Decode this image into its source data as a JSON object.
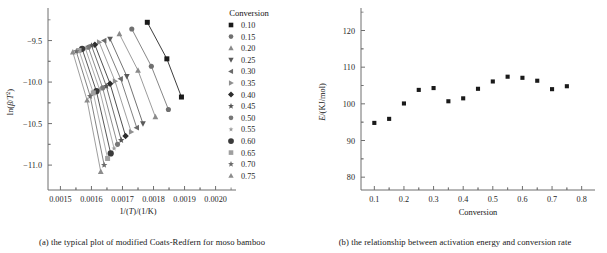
{
  "figure": {
    "panels": [
      {
        "id": "panel-a",
        "caption": "(a) the typical plot of modified Coats-Redfern for moso bamboo"
      },
      {
        "id": "panel-b",
        "caption": "(b) the relationship between activation energy and conversion rate"
      }
    ]
  },
  "legend": {
    "title": "Conversion",
    "entries": [
      {
        "label": "0.10",
        "marker": "square",
        "color": "#1a1a1a"
      },
      {
        "label": "0.15",
        "marker": "circle",
        "color": "#707070"
      },
      {
        "label": "0.20",
        "marker": "triangle-up",
        "color": "#8a8a8a"
      },
      {
        "label": "0.25",
        "marker": "triangle-down",
        "color": "#5a5a5a"
      },
      {
        "label": "0.30",
        "marker": "triangle-left",
        "color": "#6a6a6a"
      },
      {
        "label": "0.35",
        "marker": "triangle-right",
        "color": "#8f8f8f"
      },
      {
        "label": "0.40",
        "marker": "diamond",
        "color": "#2e2e2e"
      },
      {
        "label": "0.45",
        "marker": "star",
        "color": "#555555"
      },
      {
        "label": "0.50",
        "marker": "circle",
        "color": "#777777"
      },
      {
        "label": "0.55",
        "marker": "star-small",
        "color": "#9a9a9a"
      },
      {
        "label": "0.60",
        "marker": "circle-large",
        "color": "#3a3a3a"
      },
      {
        "label": "0.65",
        "marker": "square-light",
        "color": "#9f9f9f"
      },
      {
        "label": "0.70",
        "marker": "star",
        "color": "#6b6b6b"
      },
      {
        "label": "0.75",
        "marker": "triangle-up",
        "color": "#8c8c8c"
      }
    ]
  },
  "chart_data": [
    {
      "type": "line",
      "id": "coats-redfern",
      "title": "",
      "xlabel": "1/(T)/(1/K)",
      "ylabel": "ln(β/T²)",
      "xlim": [
        0.00146,
        0.00204
      ],
      "ylim": [
        -11.3,
        -9.18
      ],
      "xticks": [
        0.0015,
        0.0016,
        0.0017,
        0.0018,
        0.0019,
        0.002
      ],
      "xticklabels": [
        "0.0015",
        "0.0016",
        "0.0017",
        "0.0018",
        "0.0019",
        "0.0020"
      ],
      "yticks": [
        -9.5,
        -10.0,
        -10.5,
        -11.0
      ],
      "yticklabels": [
        "−9.5",
        "−10.0",
        "−10.5",
        "−11.0"
      ],
      "grid": false,
      "legend_position": "right",
      "series": [
        {
          "name": "0.10",
          "marker": "square",
          "color": "#1a1a1a",
          "x": [
            0.00178,
            0.001843,
            0.00189
          ],
          "y": [
            -9.28,
            -9.72,
            -10.18
          ]
        },
        {
          "name": "0.15",
          "marker": "circle",
          "color": "#707070",
          "x": [
            0.00173,
            0.001793,
            0.001848
          ],
          "y": [
            -9.36,
            -9.81,
            -10.33
          ]
        },
        {
          "name": "0.20",
          "marker": "triangle-up",
          "color": "#8a8a8a",
          "x": [
            0.00169,
            0.00175,
            0.001806
          ],
          "y": [
            -9.42,
            -9.86,
            -10.42
          ]
        },
        {
          "name": "0.25",
          "marker": "triangle-down",
          "color": "#5a5a5a",
          "x": [
            0.00166,
            0.001714,
            0.001766
          ],
          "y": [
            -9.48,
            -9.93,
            -10.5
          ]
        },
        {
          "name": "0.30",
          "marker": "triangle-left",
          "color": "#6a6a6a",
          "x": [
            0.001641,
            0.001694,
            0.001746
          ],
          "y": [
            -9.5,
            -9.96,
            -10.55
          ]
        },
        {
          "name": "0.35",
          "marker": "triangle-right",
          "color": "#8f8f8f",
          "x": [
            0.001625,
            0.001676,
            0.001728
          ],
          "y": [
            -9.52,
            -9.99,
            -10.6
          ]
        },
        {
          "name": "0.40",
          "marker": "diamond",
          "color": "#2e2e2e",
          "x": [
            0.001611,
            0.00166,
            0.00171
          ],
          "y": [
            -9.55,
            -10.02,
            -10.65
          ]
        },
        {
          "name": "0.45",
          "marker": "star",
          "color": "#555555",
          "x": [
            0.0016,
            0.001648,
            0.001696
          ],
          "y": [
            -9.56,
            -10.05,
            -10.7
          ]
        },
        {
          "name": "0.50",
          "marker": "circle",
          "color": "#777777",
          "x": [
            0.00159,
            0.001636,
            0.001684
          ],
          "y": [
            -9.58,
            -10.07,
            -10.75
          ]
        },
        {
          "name": "0.55",
          "marker": "star-small",
          "color": "#9a9a9a",
          "x": [
            0.00158,
            0.001626,
            0.001673
          ],
          "y": [
            -9.59,
            -10.09,
            -10.8
          ]
        },
        {
          "name": "0.60",
          "marker": "circle-large",
          "color": "#3a3a3a",
          "x": [
            0.00157,
            0.001616,
            0.001662
          ],
          "y": [
            -9.6,
            -10.11,
            -10.86
          ]
        },
        {
          "name": "0.65",
          "marker": "square-light",
          "color": "#9f9f9f",
          "x": [
            0.00156,
            0.001606,
            0.001652
          ],
          "y": [
            -9.62,
            -10.13,
            -10.92
          ]
        },
        {
          "name": "0.70",
          "marker": "star",
          "color": "#6b6b6b",
          "x": [
            0.001551,
            0.001596,
            0.001641
          ],
          "y": [
            -9.63,
            -10.17,
            -11.0
          ]
        },
        {
          "name": "0.75",
          "marker": "triangle-up",
          "color": "#8c8c8c",
          "x": [
            0.00154,
            0.001586,
            0.00163
          ],
          "y": [
            -9.64,
            -10.22,
            -11.08
          ]
        }
      ]
    },
    {
      "type": "scatter",
      "id": "activation-energy",
      "title": "",
      "xlabel": "Conversion",
      "ylabel": "E/(KJ/mol)",
      "xlim": [
        0.055,
        0.845
      ],
      "ylim": [
        76.5,
        124.5
      ],
      "xticks": [
        0.1,
        0.2,
        0.3,
        0.4,
        0.5,
        0.6,
        0.7,
        0.8
      ],
      "xticklabels": [
        "0.1",
        "0.2",
        "0.3",
        "0.4",
        "0.5",
        "0.6",
        "0.7",
        "0.8"
      ],
      "yticks": [
        80,
        90,
        100,
        110,
        120
      ],
      "yticklabels": [
        "80",
        "90",
        "100",
        "110",
        "120"
      ],
      "grid": false,
      "marker": "square",
      "color": "#1a1a1a",
      "x": [
        0.1,
        0.15,
        0.2,
        0.25,
        0.3,
        0.35,
        0.4,
        0.45,
        0.5,
        0.55,
        0.6,
        0.65,
        0.7,
        0.75
      ],
      "y": [
        94.8,
        95.9,
        100.1,
        103.8,
        104.3,
        100.7,
        101.5,
        104.1,
        106.1,
        107.4,
        107.1,
        106.3,
        104.0,
        104.8
      ]
    }
  ]
}
